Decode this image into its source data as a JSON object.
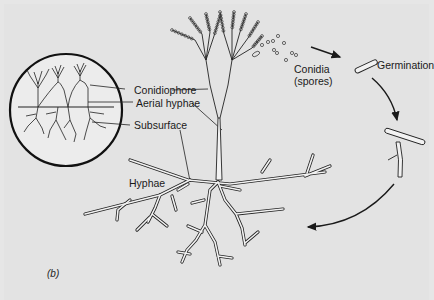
{
  "figure": {
    "panel_label": "(b)",
    "background_color": "#e3e3e3",
    "line_color": "#1a1a1a"
  },
  "inset": {
    "labels": {
      "conidiophore": "Conidiophore",
      "aerial_hyphae": "Aerial hyphae",
      "subsurface": "Subsurface"
    }
  },
  "main": {
    "labels": {
      "hyphae": "Hyphae",
      "conidia_line1": "Conidia",
      "conidia_line2": "(spores)",
      "germination": "Germination"
    }
  }
}
